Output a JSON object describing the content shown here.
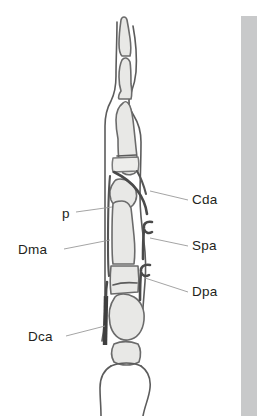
{
  "figure": {
    "type": "anatomical-line-drawing",
    "background_color": "#ffffff",
    "bone_fill_color": "#e8e8e6",
    "bone_outline_color": "#6b6b6b",
    "leader_line_color": "#9a9a9a",
    "label_text_color": "#231f20",
    "margin_band_color": "#c8c9ca"
  },
  "labels": [
    {
      "id": "cda",
      "text": "Cda",
      "side": "right",
      "text_x": 192,
      "text_y": 204,
      "leader": "M150,191 L188,200"
    },
    {
      "id": "spa",
      "text": "Spa",
      "side": "right",
      "text_x": 192,
      "text_y": 250,
      "leader": "M150,238 L188,246"
    },
    {
      "id": "dpa",
      "text": "Dpa",
      "side": "right",
      "text_x": 192,
      "text_y": 296,
      "leader": "M145,278 L188,292"
    },
    {
      "id": "p",
      "text": "p",
      "side": "left",
      "text_x": 62,
      "text_y": 218,
      "leader": "M76,212 L112,207"
    },
    {
      "id": "dma",
      "text": "Dma",
      "side": "left",
      "text_x": 18,
      "text_y": 254,
      "leader": "M64,249 L110,240"
    },
    {
      "id": "dca",
      "text": "Dca",
      "side": "left",
      "text_x": 28,
      "text_y": 341,
      "leader": "M66,336 L105,326"
    }
  ],
  "annotation_meanings": {
    "Cda": "collateral ligament, distal",
    "Spa": "sesamoid, palmar/plantar",
    "Dpa": "distal palmar/plantar annular ligament",
    "p": "phalanx",
    "Dma": "dorsal metatarsal annular structure",
    "Dca": "deep flexor tendon / distal caudal annular structure"
  }
}
